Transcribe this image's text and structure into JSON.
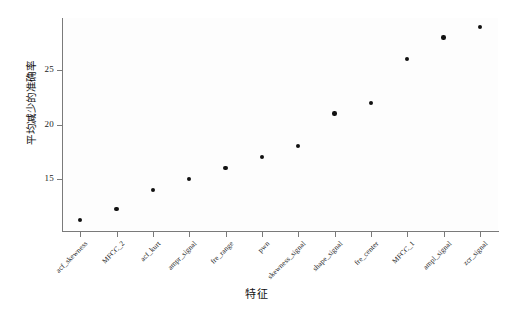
{
  "chart_data": {
    "type": "scatter",
    "title": "",
    "subtitle": "",
    "xlabel": "特征",
    "ylabel": "平均减少的准确率",
    "grid": false,
    "legend": null,
    "categories": [
      "acf_skewness",
      "MFCC_2",
      "acf_kurt",
      "ampr_signal",
      "fre_range",
      "pwn",
      "skewness_signal",
      "shape_signal",
      "fre_center",
      "MFCC_1",
      "ampl_signal",
      "zcr_signal"
    ],
    "values": [
      11.2,
      12.2,
      14.0,
      15.0,
      16.0,
      17.0,
      18.0,
      21.0,
      22.0,
      26.0,
      28.0,
      29.0
    ],
    "ylim": [
      10.2,
      29.8
    ],
    "ytick_labels": [
      "15",
      "20",
      "25"
    ],
    "ytick_values": [
      15,
      20,
      25
    ],
    "marker": "filled-circle",
    "marker_color": "#111111",
    "axis_color": "#7a7a7a",
    "background_color": "#ffffff",
    "plot_background_color": "#fdfdfd"
  }
}
